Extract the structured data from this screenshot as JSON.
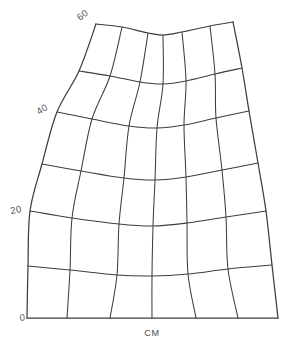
{
  "figure": {
    "kind": "curvilinear-grid-plot",
    "background_color": "#ffffff",
    "line_color": "#3d3d3d",
    "label_color": "#595959",
    "unit_caption": "CM"
  },
  "axis": {
    "name": "vertical-scale",
    "unit": "CM",
    "ticks": [
      {
        "label": "0",
        "value": 0,
        "x": 20,
        "y": 321,
        "rotation": -6
      },
      {
        "label": "20",
        "value": 20,
        "x": 11,
        "y": 214,
        "rotation": -10
      },
      {
        "label": "40",
        "value": 40,
        "x": 39,
        "y": 115,
        "rotation": -32
      },
      {
        "label": "60",
        "value": 60,
        "x": 80,
        "y": 21,
        "rotation": -38
      }
    ]
  },
  "caption": {
    "text": "CM",
    "x": 152,
    "y": 336
  },
  "chart_data": {
    "type": "line",
    "title": "",
    "xlabel": "CM",
    "ylabel": "",
    "grid": true,
    "legend": false,
    "ylim": [
      0,
      60
    ],
    "ytick_labels": [
      "0",
      "20",
      "40",
      "60"
    ],
    "ytick_values": [
      0,
      20,
      40,
      60
    ],
    "rows": 6,
    "columns": 6,
    "boundary_points": {
      "bottom_left": [
        27,
        318
      ],
      "bottom_right": [
        278,
        318
      ],
      "top_left": [
        96,
        24
      ],
      "top_right": [
        233,
        22
      ]
    },
    "horizontal_rails": [
      {
        "level": 60,
        "points": [
          [
            96,
            24
          ],
          [
            122,
            27
          ],
          [
            148,
            33
          ],
          [
            163,
            35
          ],
          [
            182,
            32
          ],
          [
            210,
            26
          ],
          [
            233,
            22
          ]
        ]
      },
      {
        "level": 50,
        "points": [
          [
            79,
            71
          ],
          [
            110,
            76
          ],
          [
            140,
            82
          ],
          [
            163,
            84
          ],
          [
            186,
            81
          ],
          [
            215,
            74
          ],
          [
            242,
            68
          ]
        ]
      },
      {
        "level": 40,
        "points": [
          [
            57,
            112
          ],
          [
            92,
            119
          ],
          [
            129,
            126
          ],
          [
            157,
            128
          ],
          [
            184,
            125
          ],
          [
            216,
            118
          ],
          [
            249,
            111
          ]
        ]
      },
      {
        "level": 30,
        "points": [
          [
            42,
            164
          ],
          [
            81,
            171
          ],
          [
            124,
            178
          ],
          [
            155,
            180
          ],
          [
            186,
            177
          ],
          [
            222,
            170
          ],
          [
            258,
            163
          ]
        ]
      },
      {
        "level": 20,
        "points": [
          [
            30,
            211
          ],
          [
            72,
            218
          ],
          [
            119,
            224
          ],
          [
            153,
            226
          ],
          [
            187,
            223
          ],
          [
            226,
            217
          ],
          [
            266,
            211
          ]
        ]
      },
      {
        "level": 10,
        "points": [
          [
            28,
            266
          ],
          [
            70,
            270
          ],
          [
            117,
            275
          ],
          [
            152,
            276
          ],
          [
            188,
            274
          ],
          [
            228,
            269
          ],
          [
            272,
            265
          ]
        ]
      },
      {
        "level": 0,
        "points": [
          [
            27,
            318
          ],
          [
            67,
            318
          ],
          [
            110,
            318
          ],
          [
            152,
            318
          ],
          [
            196,
            318
          ],
          [
            238,
            318
          ],
          [
            278,
            318
          ]
        ]
      }
    ],
    "vertical_rails": [
      {
        "index": 0,
        "points": [
          [
            96,
            24
          ],
          [
            79,
            71
          ],
          [
            57,
            112
          ],
          [
            42,
            164
          ],
          [
            30,
            211
          ],
          [
            28,
            266
          ],
          [
            27,
            318
          ]
        ]
      },
      {
        "index": 1,
        "points": [
          [
            122,
            27
          ],
          [
            110,
            76
          ],
          [
            92,
            119
          ],
          [
            81,
            171
          ],
          [
            72,
            218
          ],
          [
            70,
            270
          ],
          [
            67,
            318
          ]
        ]
      },
      {
        "index": 2,
        "points": [
          [
            148,
            33
          ],
          [
            140,
            82
          ],
          [
            129,
            126
          ],
          [
            124,
            178
          ],
          [
            119,
            224
          ],
          [
            117,
            275
          ],
          [
            110,
            318
          ]
        ]
      },
      {
        "index": 3,
        "points": [
          [
            163,
            35
          ],
          [
            163,
            84
          ],
          [
            157,
            128
          ],
          [
            155,
            180
          ],
          [
            153,
            226
          ],
          [
            152,
            276
          ],
          [
            152,
            318
          ]
        ]
      },
      {
        "index": 4,
        "points": [
          [
            182,
            32
          ],
          [
            186,
            81
          ],
          [
            184,
            125
          ],
          [
            186,
            177
          ],
          [
            187,
            223
          ],
          [
            188,
            274
          ],
          [
            196,
            318
          ]
        ]
      },
      {
        "index": 5,
        "points": [
          [
            210,
            26
          ],
          [
            215,
            74
          ],
          [
            216,
            118
          ],
          [
            222,
            170
          ],
          [
            226,
            217
          ],
          [
            228,
            269
          ],
          [
            238,
            318
          ]
        ]
      },
      {
        "index": 6,
        "points": [
          [
            233,
            22
          ],
          [
            242,
            68
          ],
          [
            249,
            111
          ],
          [
            258,
            163
          ],
          [
            266,
            211
          ],
          [
            272,
            265
          ],
          [
            278,
            318
          ]
        ]
      }
    ]
  }
}
